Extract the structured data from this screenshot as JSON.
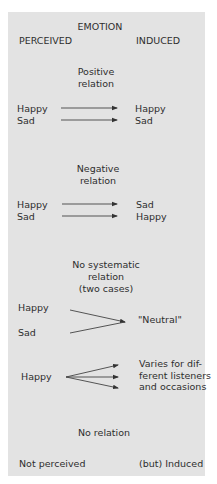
{
  "header": {
    "title": "EMOTION",
    "left_column": "PERCEIVED",
    "right_column": "INDUCED"
  },
  "sections": [
    {
      "heading": "Positive\nrelation",
      "perceived": [
        "Happy",
        "Sad"
      ],
      "induced": [
        "Happy",
        "Sad"
      ],
      "arrow_type": "parallel"
    },
    {
      "heading": "Negative\nrelation",
      "perceived": [
        "Happy",
        "Sad"
      ],
      "induced": [
        "Sad",
        "Happy"
      ],
      "arrow_type": "parallel"
    },
    {
      "heading": "No systematic\nrelation\n(two cases)",
      "case_a": {
        "perceived": [
          "Happy",
          "Sad"
        ],
        "induced": "\"Neutral\"",
        "arrow_type": "convergent"
      },
      "case_b": {
        "perceived": "Happy",
        "induced": "Varies for dif-\nferent listeners\nand occasions",
        "arrow_type": "divergent"
      }
    },
    {
      "heading": "No relation",
      "perceived": "Not perceived",
      "induced": "(but) Induced"
    }
  ],
  "colors": {
    "panel": "#e3e3e3",
    "text": "#2e2e2e",
    "arrow": "#333333"
  }
}
